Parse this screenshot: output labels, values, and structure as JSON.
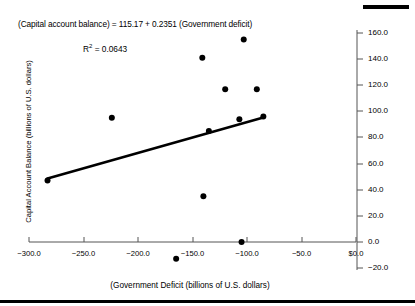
{
  "chart_data": {
    "type": "scatter",
    "title": "",
    "xlabel": "(Government Deficit (billions of U.S. dollars)",
    "ylabel": "Capital Account Balance (billions of U.S. dollars)",
    "xlim": [
      -300,
      0
    ],
    "ylim": [
      -20,
      160
    ],
    "xticks": [
      "-300.0",
      "-250.0",
      "-200.0",
      "-150.0",
      "-100.0",
      "-50.0",
      "$0.0"
    ],
    "xtick_values": [
      -300,
      -250,
      -200,
      -150,
      -100,
      -50,
      0
    ],
    "yticks": [
      "160.0",
      "140.0",
      "120.0",
      "100.0",
      "80.0",
      "60.0",
      "40.0",
      "20.0",
      "0.0",
      "-20.0"
    ],
    "ytick_values": [
      160,
      140,
      120,
      100,
      80,
      60,
      40,
      20,
      0,
      -20
    ],
    "grid": false,
    "legend": false,
    "yaxis_position": "right",
    "annotations": {
      "equation": "(Capital account balance) = 115.17 + 0.2351 (Government deficit)",
      "r_squared_label": "R",
      "r_squared_exponent": "2",
      "r_squared_value": "= 0.0643"
    },
    "series": [
      {
        "name": "observations",
        "marker": "filled-circle",
        "color": "#000000",
        "points": [
          {
            "x": -283,
            "y": 47
          },
          {
            "x": -224,
            "y": 95
          },
          {
            "x": -141,
            "y": 141
          },
          {
            "x": -103,
            "y": 155
          },
          {
            "x": -120,
            "y": 117
          },
          {
            "x": -91,
            "y": 117
          },
          {
            "x": -140,
            "y": 35
          },
          {
            "x": -105,
            "y": 0
          },
          {
            "x": -165,
            "y": -13
          },
          {
            "x": -135,
            "y": 85
          },
          {
            "x": -107,
            "y": 94
          },
          {
            "x": -85,
            "y": 96
          }
        ]
      }
    ],
    "trendline": {
      "name": "regression-line",
      "color": "#000000",
      "intercept": 115.17,
      "slope": 0.2351,
      "x_start": -283,
      "y_start": 48.6,
      "x_end": -85,
      "y_end": 95.2
    }
  }
}
